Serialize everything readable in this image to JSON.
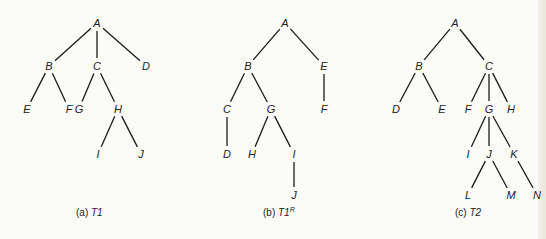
{
  "figure": {
    "trees": [
      {
        "id": "a",
        "caption_prefix": "(a) ",
        "caption_name": "T1",
        "caption_sup": "",
        "nodes": [
          {
            "label": "A",
            "x": 97,
            "y": 23
          },
          {
            "label": "B",
            "x": 49,
            "y": 66
          },
          {
            "label": "C",
            "x": 97,
            "y": 66
          },
          {
            "label": "D",
            "x": 146,
            "y": 66
          },
          {
            "label": "E",
            "x": 27,
            "y": 109
          },
          {
            "label": "F",
            "x": 69,
            "y": 109
          },
          {
            "label": "G",
            "x": 79,
            "y": 109
          },
          {
            "label": "H",
            "x": 118,
            "y": 109
          },
          {
            "label": "I",
            "x": 98,
            "y": 154
          },
          {
            "label": "J",
            "x": 141,
            "y": 154
          }
        ],
        "edges": [
          [
            "A",
            "B"
          ],
          [
            "A",
            "C"
          ],
          [
            "A",
            "D"
          ],
          [
            "B",
            "E"
          ],
          [
            "B",
            "F"
          ],
          [
            "C",
            "G"
          ],
          [
            "C",
            "H"
          ],
          [
            "H",
            "I"
          ],
          [
            "H",
            "J"
          ]
        ],
        "caption_x": 76,
        "caption_y": 216
      },
      {
        "id": "b",
        "caption_prefix": "(b) ",
        "caption_name": "T1",
        "caption_sup": "R",
        "nodes": [
          {
            "label": "A",
            "x": 285,
            "y": 23
          },
          {
            "label": "B",
            "x": 248,
            "y": 66
          },
          {
            "label": "E",
            "x": 324,
            "y": 66
          },
          {
            "label": "C",
            "x": 227,
            "y": 109
          },
          {
            "label": "G",
            "x": 271,
            "y": 109
          },
          {
            "label": "F",
            "x": 324,
            "y": 109
          },
          {
            "label": "D",
            "x": 227,
            "y": 154
          },
          {
            "label": "H",
            "x": 252,
            "y": 154
          },
          {
            "label": "I",
            "x": 294,
            "y": 154
          },
          {
            "label": "J",
            "x": 294,
            "y": 195
          }
        ],
        "edges": [
          [
            "A",
            "B"
          ],
          [
            "A",
            "E"
          ],
          [
            "B",
            "C"
          ],
          [
            "B",
            "G"
          ],
          [
            "E",
            "F"
          ],
          [
            "C",
            "D"
          ],
          [
            "G",
            "H"
          ],
          [
            "G",
            "I"
          ],
          [
            "I",
            "J"
          ]
        ],
        "caption_x": 263,
        "caption_y": 216
      },
      {
        "id": "c",
        "caption_prefix": "(c) ",
        "caption_name": "T2",
        "caption_sup": "",
        "nodes": [
          {
            "label": "A",
            "x": 455,
            "y": 23
          },
          {
            "label": "B",
            "x": 419,
            "y": 66
          },
          {
            "label": "C",
            "x": 489,
            "y": 66
          },
          {
            "label": "D",
            "x": 396,
            "y": 109
          },
          {
            "label": "E",
            "x": 442,
            "y": 109
          },
          {
            "label": "F",
            "x": 468,
            "y": 109
          },
          {
            "label": "G",
            "x": 489,
            "y": 109
          },
          {
            "label": "H",
            "x": 511,
            "y": 109
          },
          {
            "label": "I",
            "x": 468,
            "y": 154
          },
          {
            "label": "J",
            "x": 489,
            "y": 154
          },
          {
            "label": "K",
            "x": 514,
            "y": 154
          },
          {
            "label": "L",
            "x": 468,
            "y": 195
          },
          {
            "label": "M",
            "x": 511,
            "y": 195
          },
          {
            "label": "N",
            "x": 537,
            "y": 195
          }
        ],
        "edges": [
          [
            "A",
            "B"
          ],
          [
            "A",
            "C"
          ],
          [
            "B",
            "D"
          ],
          [
            "B",
            "E"
          ],
          [
            "C",
            "F"
          ],
          [
            "C",
            "G"
          ],
          [
            "C",
            "H"
          ],
          [
            "G",
            "I"
          ],
          [
            "G",
            "J"
          ],
          [
            "G",
            "K"
          ],
          [
            "J",
            "L"
          ],
          [
            "J",
            "M"
          ],
          [
            "K",
            "N"
          ]
        ],
        "caption_x": 455,
        "caption_y": 216
      }
    ]
  }
}
